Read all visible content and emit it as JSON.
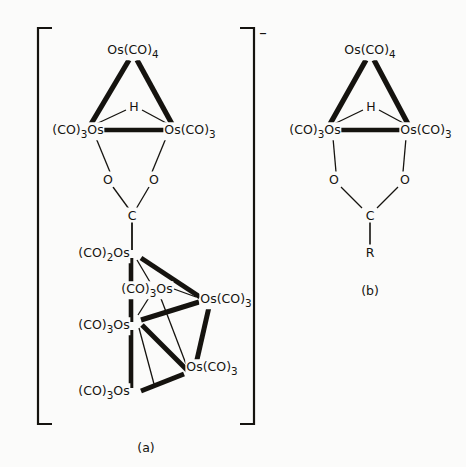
{
  "figure": {
    "background_color": "#fbfbfa",
    "ink_color": "#15130f",
    "panels": [
      {
        "id": "a",
        "caption": "(a)",
        "charge": "–",
        "bracketed": true,
        "description": "Anionic hexaosmium carboxylate-bridged cluster"
      },
      {
        "id": "b",
        "caption": "(b)",
        "charge": "",
        "bracketed": false,
        "description": "Neutral triosmium hydrido carboxylate complex"
      }
    ]
  },
  "panel_a": {
    "caption": "(a)",
    "charge_sign": "–",
    "triangle": {
      "apex_label": "Os(CO)",
      "apex_sub": "4",
      "left_label": "(CO)",
      "left_sub": "3",
      "left_tail": "Os",
      "right_label": "Os(CO)",
      "right_sub": "3",
      "bridge_hydride": "H"
    },
    "carboxylate": {
      "oxygen_left": "O",
      "oxygen_right": "O",
      "carbon": "C"
    },
    "cluster": {
      "vertices": [
        {
          "name": "os-top-left",
          "label": "(CO)",
          "sub": "2",
          "tail": "Os",
          "align": "right"
        },
        {
          "name": "os-inner",
          "label": "(CO)",
          "sub": "3",
          "tail": "Os",
          "align": "right"
        },
        {
          "name": "os-mid-left",
          "label": "(CO)",
          "sub": "3",
          "tail": "Os",
          "align": "right"
        },
        {
          "name": "os-bottom-left",
          "label": "(CO)",
          "sub": "3",
          "tail": "Os",
          "align": "right"
        },
        {
          "name": "os-right",
          "label": "Os(CO)",
          "sub": "3",
          "tail": "",
          "align": "left"
        },
        {
          "name": "os-bottom-right",
          "label": "Os(CO)",
          "sub": "3",
          "tail": "",
          "align": "left"
        }
      ]
    }
  },
  "panel_b": {
    "caption": "(b)",
    "triangle": {
      "apex_label": "Os(CO)",
      "apex_sub": "4",
      "left_label": "(CO)",
      "left_sub": "3",
      "left_tail": "Os",
      "right_label": "Os(CO)",
      "right_sub": "3",
      "bridge_hydride": "H"
    },
    "carboxylate": {
      "oxygen_left": "O",
      "oxygen_right": "O",
      "carbon": "C",
      "substituent": "R"
    }
  }
}
